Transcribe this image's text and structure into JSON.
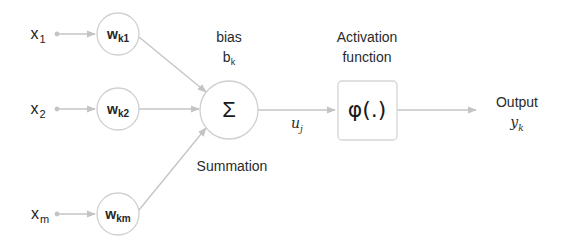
{
  "diagram": {
    "colors": {
      "edge": "#c4c4c4",
      "node_border": "#cfcfcf",
      "text": "#222222",
      "background": "#ffffff"
    },
    "inputs": [
      {
        "id": "x1",
        "symbol": "x",
        "subscript": "1"
      },
      {
        "id": "x2",
        "symbol": "x",
        "subscript": "2"
      },
      {
        "id": "xm",
        "symbol": "x",
        "subscript": "m"
      }
    ],
    "weights": [
      {
        "id": "wk1",
        "symbol": "w",
        "subscript": "k1"
      },
      {
        "id": "wk2",
        "symbol": "w",
        "subscript": "k2"
      },
      {
        "id": "wkm",
        "symbol": "w",
        "subscript": "km"
      }
    ],
    "bias": {
      "label": "bias",
      "symbol": "b",
      "subscript": "k"
    },
    "summation": {
      "symbol": "Σ",
      "caption": "Summation"
    },
    "intermediate": {
      "symbol": "u",
      "subscript": "j"
    },
    "activation": {
      "caption_line1": "Activation",
      "caption_line2": "function",
      "symbol": "φ(.)"
    },
    "output": {
      "caption": "Output",
      "symbol": "y",
      "subscript": "k"
    }
  }
}
